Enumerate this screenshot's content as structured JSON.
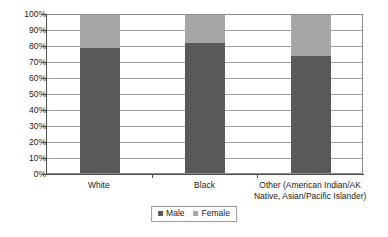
{
  "chart_data": {
    "type": "bar",
    "subtype": "100% stacked column",
    "title": "",
    "subtitle": "",
    "xlabel": "",
    "ylabel": "",
    "categories": [
      "White",
      "Black",
      "Other (American Indian/AK Native, Asian/Pacific Islander)"
    ],
    "series": [
      {
        "name": "Male",
        "color": "#595959",
        "values": [
          79,
          82,
          74
        ]
      },
      {
        "name": "Female",
        "color": "#a6a6a6",
        "values": [
          21,
          18,
          26
        ]
      }
    ],
    "ylim": [
      0,
      100
    ],
    "y_tick_labels": [
      "100%",
      "90%",
      "80%",
      "70%",
      "60%",
      "50%",
      "40%",
      "30%",
      "20%",
      "10%",
      "0%"
    ],
    "y_tick_values": [
      100,
      90,
      80,
      70,
      60,
      50,
      40,
      30,
      20,
      10,
      0
    ],
    "grid": true,
    "grid_axis": "y",
    "legend_position": "bottom-center",
    "legend_entries": [
      "Male",
      "Female"
    ],
    "annotations": []
  },
  "category_label_lines": [
    [
      "White"
    ],
    [
      "Black"
    ],
    [
      "Other (American Indian/AK",
      "Native, Asian/Pacific Islander)"
    ]
  ],
  "legend": {
    "male_label": "Male",
    "female_label": "Female",
    "male_color": "#595959",
    "female_color": "#a6a6a6"
  }
}
